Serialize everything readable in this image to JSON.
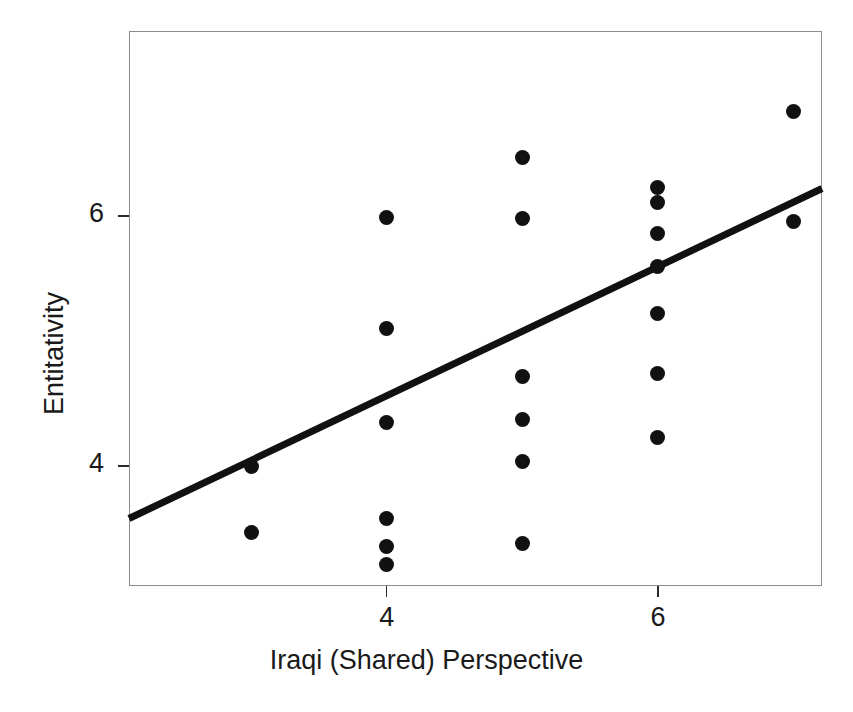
{
  "figure": {
    "background_color": "#ffffff",
    "frame_color": "#8c8c8c",
    "marker_color": "#111111",
    "line_color": "#111111"
  },
  "axes": {
    "x_title": "Iraqi (Shared) Perspective",
    "y_title": "Entitativity",
    "x_ticks": [
      {
        "label": "4",
        "value": 4
      },
      {
        "label": "6",
        "value": 6
      }
    ],
    "y_ticks": [
      {
        "label": "6",
        "value": 6
      },
      {
        "label": "4",
        "value": 4
      }
    ]
  },
  "chart_data": {
    "type": "scatter",
    "title": "",
    "xlabel": "Iraqi (Shared) Perspective",
    "ylabel": "Entitativity",
    "xlim": [
      2.1,
      7.21
    ],
    "ylim": [
      3.04,
      7.48
    ],
    "grid": false,
    "legend": null,
    "xticks": [
      4,
      6
    ],
    "yticks": [
      4,
      6
    ],
    "points": [
      {
        "x": 3.0,
        "y": 4.0
      },
      {
        "x": 3.0,
        "y": 3.47
      },
      {
        "x": 4.0,
        "y": 5.99
      },
      {
        "x": 4.0,
        "y": 5.1
      },
      {
        "x": 4.0,
        "y": 4.35
      },
      {
        "x": 4.0,
        "y": 3.58
      },
      {
        "x": 4.0,
        "y": 3.36
      },
      {
        "x": 4.0,
        "y": 3.21
      },
      {
        "x": 5.0,
        "y": 6.47
      },
      {
        "x": 5.0,
        "y": 5.98
      },
      {
        "x": 5.0,
        "y": 4.72
      },
      {
        "x": 5.0,
        "y": 4.37
      },
      {
        "x": 5.0,
        "y": 4.04
      },
      {
        "x": 5.0,
        "y": 3.38
      },
      {
        "x": 6.0,
        "y": 6.23
      },
      {
        "x": 6.0,
        "y": 6.11
      },
      {
        "x": 6.0,
        "y": 5.86
      },
      {
        "x": 6.0,
        "y": 5.6
      },
      {
        "x": 6.0,
        "y": 5.22
      },
      {
        "x": 6.0,
        "y": 4.74
      },
      {
        "x": 6.0,
        "y": 4.23
      },
      {
        "x": 7.0,
        "y": 6.84
      },
      {
        "x": 7.0,
        "y": 5.96
      }
    ],
    "fit_line": {
      "type": "linear-regression",
      "x_start": 2.1,
      "y_start": 3.58,
      "x_end": 7.21,
      "y_end": 6.22,
      "width_px": 7
    }
  }
}
